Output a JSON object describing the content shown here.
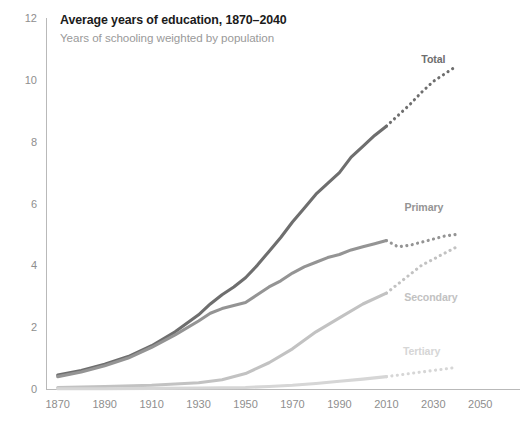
{
  "chart_data": {
    "type": "line",
    "title": "Average years of education, 1870–2040",
    "subtitle": "Years of schooling weighted by population",
    "xlabel": "",
    "ylabel": "",
    "xlim": [
      1865,
      2055
    ],
    "ylim": [
      0,
      12
    ],
    "grid": false,
    "legend_position": "inline-right",
    "x_ticks": [
      1870,
      1890,
      1910,
      1930,
      1950,
      1970,
      1990,
      2010,
      2030,
      2050
    ],
    "y_ticks": [
      0,
      2,
      4,
      6,
      8,
      10,
      12
    ],
    "projection_start_year": 2010,
    "series": [
      {
        "name": "Total",
        "color": "#6e6e6e",
        "label": "Total",
        "label_x": 2030,
        "label_y": 10.55,
        "width": 3.1,
        "x": [
          1870,
          1880,
          1890,
          1900,
          1910,
          1920,
          1930,
          1935,
          1940,
          1945,
          1950,
          1955,
          1960,
          1965,
          1970,
          1975,
          1980,
          1985,
          1990,
          1995,
          2000,
          2005,
          2010
        ],
        "values": [
          0.45,
          0.6,
          0.8,
          1.05,
          1.4,
          1.85,
          2.4,
          2.75,
          3.05,
          3.3,
          3.6,
          4.0,
          4.45,
          4.9,
          5.4,
          5.85,
          6.3,
          6.65,
          7.0,
          7.5,
          7.85,
          8.2,
          8.5
        ],
        "projection_x": [
          2010,
          2015,
          2020,
          2025,
          2030,
          2035,
          2040
        ],
        "projection_values": [
          8.5,
          8.85,
          9.2,
          9.6,
          9.95,
          10.2,
          10.45
        ]
      },
      {
        "name": "Primary",
        "color": "#949494",
        "label": "Primary",
        "label_x": 2026,
        "label_y": 5.75,
        "width": 3.1,
        "x": [
          1870,
          1880,
          1890,
          1900,
          1910,
          1920,
          1930,
          1935,
          1940,
          1945,
          1950,
          1955,
          1960,
          1965,
          1970,
          1975,
          1980,
          1985,
          1990,
          1995,
          2000,
          2005,
          2010
        ],
        "values": [
          0.4,
          0.55,
          0.75,
          1.0,
          1.35,
          1.75,
          2.2,
          2.45,
          2.6,
          2.7,
          2.8,
          3.05,
          3.3,
          3.5,
          3.75,
          3.95,
          4.1,
          4.25,
          4.35,
          4.5,
          4.6,
          4.7,
          4.8
        ],
        "projection_x": [
          2010,
          2015,
          2020,
          2025,
          2030,
          2035,
          2040
        ],
        "projection_values": [
          4.8,
          4.6,
          4.65,
          4.75,
          4.85,
          4.95,
          5.0
        ]
      },
      {
        "name": "Secondary",
        "color": "#c2c2c2",
        "label": "Secondary",
        "label_x": 2029,
        "label_y": 2.85,
        "width": 3.1,
        "x": [
          1870,
          1890,
          1910,
          1930,
          1940,
          1950,
          1960,
          1970,
          1980,
          1990,
          2000,
          2010
        ],
        "values": [
          0.05,
          0.08,
          0.12,
          0.2,
          0.3,
          0.5,
          0.85,
          1.3,
          1.85,
          2.3,
          2.75,
          3.1
        ],
        "projection_x": [
          2010,
          2015,
          2020,
          2025,
          2030,
          2035,
          2040
        ],
        "projection_values": [
          3.1,
          3.4,
          3.7,
          4.0,
          4.2,
          4.4,
          4.6
        ]
      },
      {
        "name": "Tertiary",
        "color": "#d6d6d6",
        "label": "Tertiary",
        "label_x": 2025,
        "label_y": 1.1,
        "width": 3.1,
        "x": [
          1870,
          1890,
          1910,
          1930,
          1950,
          1960,
          1970,
          1980,
          1990,
          2000,
          2010
        ],
        "values": [
          0.01,
          0.01,
          0.02,
          0.03,
          0.05,
          0.08,
          0.12,
          0.18,
          0.25,
          0.32,
          0.4
        ],
        "projection_x": [
          2010,
          2015,
          2020,
          2025,
          2030,
          2035,
          2040
        ],
        "projection_values": [
          0.4,
          0.45,
          0.5,
          0.55,
          0.6,
          0.65,
          0.7
        ]
      }
    ]
  }
}
